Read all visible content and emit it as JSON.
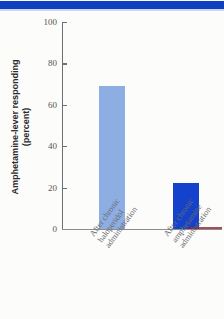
{
  "figure": {
    "background_color": "#fcfcfb",
    "header_rule_color": "#0d3fc0"
  },
  "chart_data": {
    "type": "bar",
    "title": "",
    "xlabel": "",
    "ylabel": "Amphetamine-lever responding (percent)",
    "ylabel_line1": "Amphetamine-lever responding",
    "ylabel_line2": "(percent)",
    "categories": [
      "After chronic haloperidol administration",
      "After chronic amphetamine administration"
    ],
    "category_lines": [
      [
        "After chronic",
        "haloperidol",
        "administration"
      ],
      [
        "After chronic",
        "amphetamine",
        "administration"
      ]
    ],
    "values": [
      69,
      22
    ],
    "bar_colors": [
      "#8caee3",
      "#1442cc"
    ],
    "ylim": [
      0,
      100
    ],
    "yticks": [
      0,
      20,
      40,
      60,
      80,
      100
    ],
    "ytick_labels": [
      "0",
      "20",
      "40",
      "60",
      "80",
      "100"
    ],
    "grid": false,
    "legend": null
  }
}
